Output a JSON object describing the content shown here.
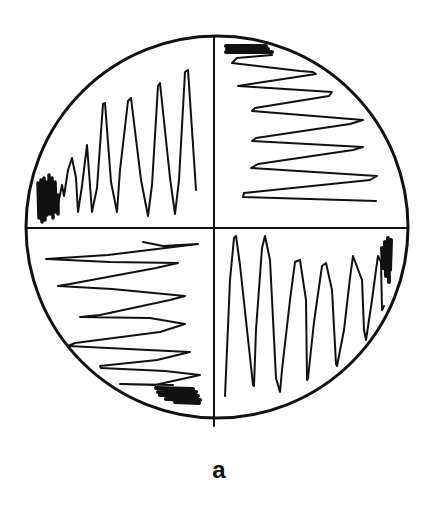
{
  "figure": {
    "caption": "a",
    "colors": {
      "stroke": "#111111",
      "background": "#ffffff"
    },
    "circle": {
      "cx": 217,
      "cy": 227,
      "r": 191
    },
    "dividers": {
      "vertical_x": 214,
      "horizontal_y": 228
    },
    "quadrants": [
      {
        "position": "top-left",
        "orientation": "vertical peaks",
        "direction": "left-to-right, increasing amplitude",
        "scribble": "bottom-left",
        "peaks": 7
      },
      {
        "position": "top-right",
        "orientation": "horizontal zigzag",
        "direction": "top-to-bottom, increasing amplitude",
        "scribble": "top-left",
        "peaks": 6
      },
      {
        "position": "bottom-left",
        "orientation": "horizontal zigzag",
        "direction": "top-to-bottom, decreasing amplitude",
        "scribble": "bottom-right",
        "peaks": 6
      },
      {
        "position": "bottom-right",
        "orientation": "vertical valleys",
        "direction": "left-to-right, decreasing amplitude",
        "scribble": "top-right",
        "peaks": 7
      }
    ]
  }
}
